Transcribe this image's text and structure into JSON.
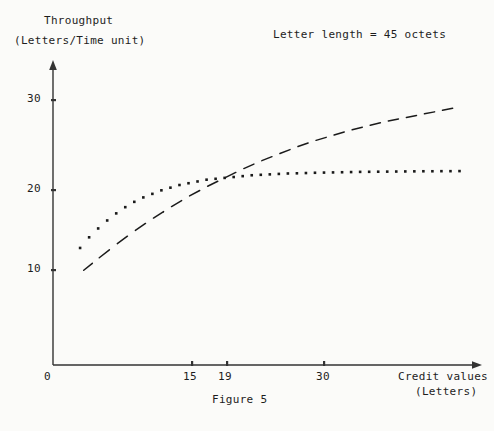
{
  "figure": {
    "caption": "Figure 5",
    "annotation": "Letter length = 45 octets",
    "y_axis_label_line1": "Throughput",
    "y_axis_label_line2": "(Letters/Time unit)",
    "x_axis_label_line1": "Credit values",
    "x_axis_label_line2": "(Letters)"
  },
  "chart_data": {
    "type": "line",
    "title": "",
    "subtitle": "",
    "annotations": [
      "Letter length = 45 octets",
      "Figure 5"
    ],
    "xlabel": "Credit values (Letters)",
    "ylabel": "Throughput (Letters/Time unit)",
    "xlim": [
      0,
      47
    ],
    "ylim": [
      0,
      33
    ],
    "xticks": [
      0,
      15,
      19,
      30
    ],
    "xtick_labels": [
      "0",
      "15",
      "19",
      "30"
    ],
    "yticks": [
      10,
      20,
      30
    ],
    "ytick_labels": [
      "10",
      "20",
      "30"
    ],
    "grid": false,
    "legend": "none",
    "axis_style": "arrowed-spines",
    "series": [
      {
        "name": "dotted-curve",
        "style": "dotted",
        "marker": "square-dot",
        "x": [
          3,
          4,
          5,
          6,
          7,
          8,
          9,
          10,
          11,
          12,
          13,
          14,
          15,
          16,
          17,
          18,
          19,
          20,
          21,
          22,
          23,
          24,
          25,
          26,
          27,
          28,
          29,
          30,
          31,
          32,
          33,
          34,
          35,
          36,
          37,
          38,
          39,
          40,
          41,
          42,
          43,
          44,
          45
        ],
        "y": [
          13.2,
          14.4,
          15.4,
          16.3,
          17.1,
          17.8,
          18.4,
          18.9,
          19.3,
          19.7,
          20.0,
          20.3,
          20.5,
          20.7,
          20.9,
          21.0,
          21.1,
          21.2,
          21.3,
          21.4,
          21.45,
          21.5,
          21.55,
          21.6,
          21.62,
          21.65,
          21.68,
          21.7,
          21.72,
          21.74,
          21.76,
          21.78,
          21.79,
          21.8,
          21.81,
          21.82,
          21.83,
          21.84,
          21.85,
          21.85,
          21.86,
          21.86,
          21.87
        ]
      },
      {
        "name": "dashed-curve",
        "style": "dashed",
        "marker": "none",
        "x": [
          3.3,
          5,
          7,
          9,
          11,
          13,
          15,
          17,
          19,
          21,
          23,
          25,
          27,
          29,
          31,
          33,
          35,
          37,
          39,
          41,
          43,
          45
        ],
        "y": [
          10.6,
          12.0,
          13.6,
          15.1,
          16.5,
          17.8,
          19.0,
          20.1,
          21.1,
          22.1,
          23.0,
          23.8,
          24.6,
          25.3,
          25.9,
          26.5,
          27.0,
          27.5,
          27.9,
          28.3,
          28.7,
          29.1
        ]
      }
    ]
  }
}
